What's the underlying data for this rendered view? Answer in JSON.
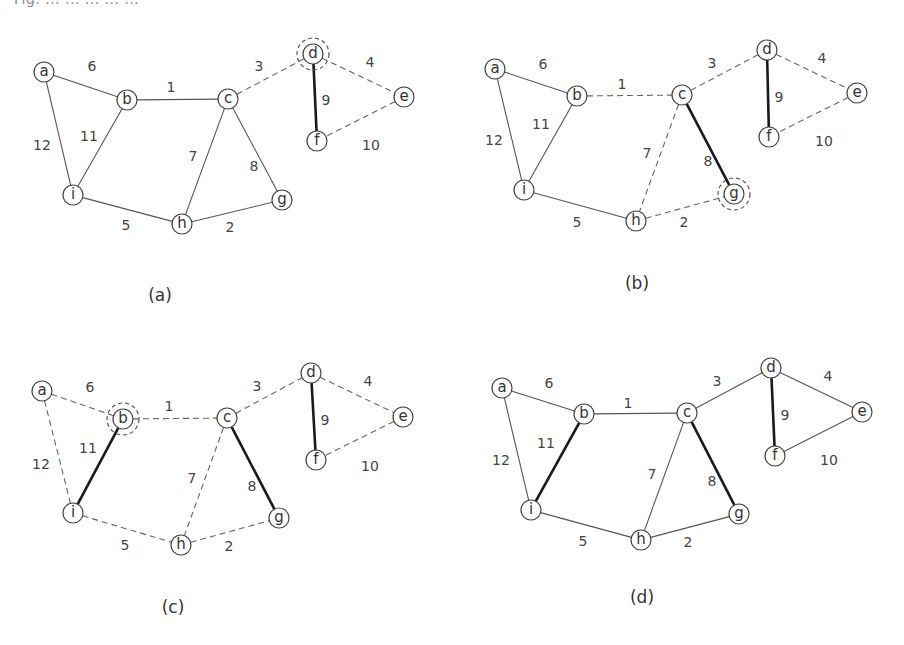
{
  "figure": {
    "top_caption_partial": "Fig. ... ... ... ... ...",
    "edge_weights": {
      "a-b": "6",
      "b-c": "1",
      "c-d": "3",
      "d-e": "4",
      "d-f": "9",
      "e-f": "10",
      "a-i": "12",
      "b-i": "11",
      "c-h": "7",
      "c-g": "8",
      "i-h": "5",
      "h-g": "2"
    },
    "panels": [
      {
        "id": "a",
        "caption": "(a)",
        "caption_pos": [
          160,
          295
        ],
        "highlighted_node": "d",
        "nodes": {
          "a": [
            44,
            72
          ],
          "b": [
            127,
            100
          ],
          "c": [
            228,
            99
          ],
          "d": [
            313,
            54
          ],
          "e": [
            404,
            97
          ],
          "f": [
            317,
            141
          ],
          "g": [
            282,
            200
          ],
          "h": [
            182,
            224
          ],
          "i": [
            73,
            195
          ]
        },
        "edges": [
          {
            "from": "a",
            "to": "b",
            "style": "solid",
            "label_pos": [
              92,
              66
            ]
          },
          {
            "from": "b",
            "to": "c",
            "style": "solid",
            "label_pos": [
              171,
              87
            ]
          },
          {
            "from": "c",
            "to": "d",
            "style": "dashed",
            "label_pos": [
              259,
              66
            ]
          },
          {
            "from": "d",
            "to": "e",
            "style": "dashed",
            "label_pos": [
              370,
              62
            ]
          },
          {
            "from": "d",
            "to": "f",
            "style": "bold",
            "label_pos": [
              326,
              100
            ]
          },
          {
            "from": "e",
            "to": "f",
            "style": "dashed",
            "label_pos": [
              371,
              145
            ]
          },
          {
            "from": "a",
            "to": "i",
            "style": "solid",
            "label_pos": [
              42,
              145
            ]
          },
          {
            "from": "b",
            "to": "i",
            "style": "solid",
            "label_pos": [
              89,
              136
            ]
          },
          {
            "from": "c",
            "to": "h",
            "style": "solid",
            "label_pos": [
              193,
              156
            ]
          },
          {
            "from": "c",
            "to": "g",
            "style": "solid",
            "label_pos": [
              254,
              166
            ]
          },
          {
            "from": "i",
            "to": "h",
            "style": "solid",
            "label_pos": [
              126,
              225
            ]
          },
          {
            "from": "h",
            "to": "g",
            "style": "solid",
            "label_pos": [
              230,
              227
            ]
          }
        ]
      },
      {
        "id": "b",
        "caption": "(b)",
        "caption_pos": [
          637,
          283
        ],
        "highlighted_node": "g",
        "nodes": {
          "a": [
            495,
            69
          ],
          "b": [
            577,
            96
          ],
          "c": [
            682,
            95
          ],
          "d": [
            767,
            50
          ],
          "e": [
            857,
            93
          ],
          "f": [
            769,
            137
          ],
          "g": [
            734,
            194
          ],
          "h": [
            636,
            221
          ],
          "i": [
            524,
            190
          ]
        },
        "edges": [
          {
            "from": "a",
            "to": "b",
            "style": "solid",
            "label_pos": [
              543,
              64
            ]
          },
          {
            "from": "b",
            "to": "c",
            "style": "dashed",
            "label_pos": [
              622,
              84
            ]
          },
          {
            "from": "c",
            "to": "d",
            "style": "dashed",
            "label_pos": [
              712,
              63
            ]
          },
          {
            "from": "d",
            "to": "e",
            "style": "dashed",
            "label_pos": [
              822,
              58
            ]
          },
          {
            "from": "d",
            "to": "f",
            "style": "bold",
            "label_pos": [
              779,
              97
            ]
          },
          {
            "from": "e",
            "to": "f",
            "style": "dashed",
            "label_pos": [
              824,
              141
            ]
          },
          {
            "from": "a",
            "to": "i",
            "style": "solid",
            "label_pos": [
              494,
              140
            ]
          },
          {
            "from": "b",
            "to": "i",
            "style": "solid",
            "label_pos": [
              541,
              124
            ]
          },
          {
            "from": "c",
            "to": "h",
            "style": "dashed",
            "label_pos": [
              647,
              153
            ]
          },
          {
            "from": "c",
            "to": "g",
            "style": "dashed_bold_override",
            "label_pos": [
              708,
              161
            ]
          },
          {
            "from": "i",
            "to": "h",
            "style": "solid",
            "label_pos": [
              577,
              222
            ]
          },
          {
            "from": "h",
            "to": "g",
            "style": "dashed",
            "label_pos": [
              684,
              222
            ]
          }
        ]
      },
      {
        "id": "c",
        "caption": "(c)",
        "caption_pos": [
          173,
          607
        ],
        "highlighted_node": "b",
        "nodes": {
          "a": [
            42,
            391
          ],
          "b": [
            123,
            419
          ],
          "c": [
            227,
            418
          ],
          "d": [
            311,
            373
          ],
          "e": [
            403,
            417
          ],
          "f": [
            316,
            460
          ],
          "g": [
            279,
            518
          ],
          "h": [
            181,
            545
          ],
          "i": [
            73,
            513
          ]
        },
        "edges": [
          {
            "from": "a",
            "to": "b",
            "style": "dashed",
            "label_pos": [
              90,
              387
            ]
          },
          {
            "from": "b",
            "to": "c",
            "style": "dashed",
            "label_pos": [
              169,
              406
            ]
          },
          {
            "from": "c",
            "to": "d",
            "style": "dashed",
            "label_pos": [
              257,
              386
            ]
          },
          {
            "from": "d",
            "to": "e",
            "style": "dashed",
            "label_pos": [
              368,
              381
            ]
          },
          {
            "from": "d",
            "to": "f",
            "style": "bold",
            "label_pos": [
              325,
              420
            ]
          },
          {
            "from": "e",
            "to": "f",
            "style": "dashed",
            "label_pos": [
              370,
              466
            ]
          },
          {
            "from": "a",
            "to": "i",
            "style": "dashed",
            "label_pos": [
              41,
              464
            ]
          },
          {
            "from": "b",
            "to": "i",
            "style": "bold",
            "label_pos": [
              88,
              448
            ]
          },
          {
            "from": "c",
            "to": "h",
            "style": "dashed",
            "label_pos": [
              192,
              478
            ]
          },
          {
            "from": "c",
            "to": "g",
            "style": "bold",
            "label_pos": [
              252,
              486
            ]
          },
          {
            "from": "i",
            "to": "h",
            "style": "dashed",
            "label_pos": [
              125,
              545
            ]
          },
          {
            "from": "h",
            "to": "g",
            "style": "dashed",
            "label_pos": [
              229,
              546
            ]
          }
        ]
      },
      {
        "id": "d",
        "caption": "(d)",
        "caption_pos": [
          642,
          597
        ],
        "highlighted_node": null,
        "nodes": {
          "a": [
            502,
            388
          ],
          "b": [
            584,
            414
          ],
          "c": [
            687,
            413
          ],
          "d": [
            771,
            368
          ],
          "e": [
            862,
            412
          ],
          "f": [
            775,
            456
          ],
          "g": [
            739,
            514
          ],
          "h": [
            641,
            540
          ],
          "i": [
            531,
            510
          ]
        },
        "edges": [
          {
            "from": "a",
            "to": "b",
            "style": "solid",
            "label_pos": [
              549,
              383
            ]
          },
          {
            "from": "b",
            "to": "c",
            "style": "solid",
            "label_pos": [
              628,
              403
            ]
          },
          {
            "from": "c",
            "to": "d",
            "style": "solid",
            "label_pos": [
              717,
              381
            ]
          },
          {
            "from": "d",
            "to": "e",
            "style": "solid",
            "label_pos": [
              828,
              376
            ]
          },
          {
            "from": "d",
            "to": "f",
            "style": "bold",
            "label_pos": [
              785,
              415
            ]
          },
          {
            "from": "e",
            "to": "f",
            "style": "solid",
            "label_pos": [
              829,
              460
            ]
          },
          {
            "from": "a",
            "to": "i",
            "style": "solid",
            "label_pos": [
              501,
              460
            ]
          },
          {
            "from": "b",
            "to": "i",
            "style": "bold",
            "label_pos": [
              546,
              443
            ]
          },
          {
            "from": "c",
            "to": "h",
            "style": "solid",
            "label_pos": [
              652,
              474
            ]
          },
          {
            "from": "c",
            "to": "g",
            "style": "bold",
            "label_pos": [
              712,
              481
            ]
          },
          {
            "from": "i",
            "to": "h",
            "style": "solid",
            "label_pos": [
              583,
              541
            ]
          },
          {
            "from": "h",
            "to": "g",
            "style": "solid",
            "label_pos": [
              688,
              542
            ]
          }
        ]
      }
    ]
  }
}
